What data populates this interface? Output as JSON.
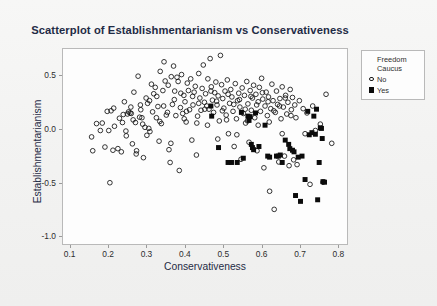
{
  "chart_data": {
    "type": "scatter",
    "title": "Scatterplot of Establishmentarianism vs Conservativeness",
    "xlabel": "Conservativeness",
    "ylabel": "Establishmentarianism",
    "xlim": [
      0.08,
      0.825
    ],
    "ylim": [
      -1.08,
      0.75
    ],
    "xticks": [
      0.1,
      0.2,
      0.3,
      0.4,
      0.5,
      0.6,
      0.7,
      0.8
    ],
    "xtick_labels": [
      "0.1",
      "0.2",
      "0.3",
      "0.4",
      "0.5",
      "0.6",
      "0.7",
      "0.8"
    ],
    "yticks": [
      0.5,
      0.0,
      -0.5,
      -1.0
    ],
    "ytick_labels": [
      "0.5",
      "0.0",
      "-0.5",
      "-1.0"
    ],
    "grid": false,
    "legend_position": "outside-top-right",
    "legend": {
      "title_line1": "Freedom",
      "title_line2": "Caucus",
      "entries": [
        {
          "label": "No",
          "marker": "open-circle",
          "color": "#111111"
        },
        {
          "label": "Yes",
          "marker": "filled-square",
          "color": "#0b0b0b"
        }
      ]
    },
    "series": [
      {
        "name": "No",
        "marker": "open-circle",
        "color": "#111111",
        "points": [
          [
            0.155,
            -0.075
          ],
          [
            0.158,
            -0.205
          ],
          [
            0.178,
            -0.015
          ],
          [
            0.183,
            0.055
          ],
          [
            0.196,
            0.165
          ],
          [
            0.2,
            -0.015
          ],
          [
            0.203,
            -0.505
          ],
          [
            0.206,
            0.17
          ],
          [
            0.211,
            -0.2
          ],
          [
            0.215,
            0.025
          ],
          [
            0.224,
            -0.185
          ],
          [
            0.228,
            0.1
          ],
          [
            0.233,
            -0.215
          ],
          [
            0.236,
            0.06
          ],
          [
            0.241,
            0.255
          ],
          [
            0.245,
            -0.02
          ],
          [
            0.249,
            0.14
          ],
          [
            0.252,
            0.16
          ],
          [
            0.256,
            0.15
          ],
          [
            0.259,
            0.145
          ],
          [
            0.262,
            -0.14
          ],
          [
            0.266,
            0.345
          ],
          [
            0.27,
            0.06
          ],
          [
            0.273,
            -0.205
          ],
          [
            0.277,
            0.495
          ],
          [
            0.281,
            0.11
          ],
          [
            0.284,
            0.18
          ],
          [
            0.287,
            0.105
          ],
          [
            0.291,
            -0.27
          ],
          [
            0.295,
            0.015
          ],
          [
            0.298,
            0.29
          ],
          [
            0.302,
            0.24
          ],
          [
            0.305,
            0.005
          ],
          [
            0.308,
            -0.025
          ],
          [
            0.312,
            0.42
          ],
          [
            0.315,
            0.16
          ],
          [
            0.318,
            0.33
          ],
          [
            0.322,
            0.39
          ],
          [
            0.325,
            0.105
          ],
          [
            0.329,
            0.21
          ],
          [
            0.332,
            -0.115
          ],
          [
            0.335,
            0.54
          ],
          [
            0.338,
            0.05
          ],
          [
            0.342,
            0.36
          ],
          [
            0.345,
            0.63
          ],
          [
            0.348,
            0.45
          ],
          [
            0.351,
            0.13
          ],
          [
            0.354,
            0.155
          ],
          [
            0.358,
            -0.195
          ],
          [
            0.361,
            -0.315
          ],
          [
            0.364,
            0.49
          ],
          [
            0.367,
            0.23
          ],
          [
            0.37,
            0.59
          ],
          [
            0.373,
            0.355
          ],
          [
            0.376,
            0.125
          ],
          [
            0.379,
            0.485
          ],
          [
            0.382,
            0.445
          ],
          [
            0.385,
            -0.39
          ],
          [
            0.388,
            0.2
          ],
          [
            0.391,
            0.51
          ],
          [
            0.394,
            0.145
          ],
          [
            0.397,
            0.315
          ],
          [
            0.4,
            0.255
          ],
          [
            0.403,
            0.065
          ],
          [
            0.406,
            0.43
          ],
          [
            0.409,
            0.36
          ],
          [
            0.412,
            0.18
          ],
          [
            0.415,
            0.47
          ],
          [
            0.418,
            -0.105
          ],
          [
            0.421,
            0.225
          ],
          [
            0.424,
            0.345
          ],
          [
            0.427,
            0.4
          ],
          [
            0.43,
            -0.245
          ],
          [
            0.433,
            0.12
          ],
          [
            0.436,
            0.52
          ],
          [
            0.439,
            0.29
          ],
          [
            0.442,
            0.175
          ],
          [
            0.445,
            0.38
          ],
          [
            0.448,
            0.6
          ],
          [
            0.451,
            0.25
          ],
          [
            0.454,
            0.33
          ],
          [
            0.457,
            0.215
          ],
          [
            0.46,
            0.47
          ],
          [
            0.463,
            0.185
          ],
          [
            0.466,
            0.66
          ],
          [
            0.469,
            0.395
          ],
          [
            0.472,
            0.27
          ],
          [
            0.475,
            0.155
          ],
          [
            0.478,
            0.34
          ],
          [
            0.481,
            0.44
          ],
          [
            0.484,
            0.225
          ],
          [
            0.487,
            0.31
          ],
          [
            0.49,
            0.075
          ],
          [
            0.493,
            0.69
          ],
          [
            0.496,
            0.415
          ],
          [
            0.499,
            0.285
          ],
          [
            0.502,
            0.195
          ],
          [
            0.505,
            0.355
          ],
          [
            0.508,
            0.13
          ],
          [
            0.511,
            0.46
          ],
          [
            0.514,
            -0.045
          ],
          [
            0.517,
            0.24
          ],
          [
            0.52,
            0.37
          ],
          [
            0.523,
            0.3
          ],
          [
            0.526,
            0.165
          ],
          [
            0.529,
            -0.165
          ],
          [
            0.532,
            0.425
          ],
          [
            0.535,
            0.095
          ],
          [
            0.538,
            0.265
          ],
          [
            0.541,
            0.335
          ],
          [
            0.544,
            0.205
          ],
          [
            0.547,
            -0.285
          ],
          [
            0.55,
            0.385
          ],
          [
            0.553,
            0.145
          ],
          [
            0.556,
            0.315
          ],
          [
            0.559,
            0.055
          ],
          [
            0.562,
            0.445
          ],
          [
            0.565,
            0.235
          ],
          [
            0.568,
            -0.125
          ],
          [
            0.571,
            0.36
          ],
          [
            0.574,
            0.175
          ],
          [
            0.577,
            0.29
          ],
          [
            0.58,
            0.41
          ],
          [
            0.583,
            0.105
          ],
          [
            0.586,
            0.325
          ],
          [
            0.589,
            -0.205
          ],
          [
            0.592,
            0.255
          ],
          [
            0.595,
            0.39
          ],
          [
            0.598,
            0.165
          ],
          [
            0.601,
            0.475
          ],
          [
            0.604,
            0.28
          ],
          [
            0.607,
            -0.365
          ],
          [
            0.61,
            0.215
          ],
          [
            0.613,
            0.345
          ],
          [
            0.616,
            0.125
          ],
          [
            0.619,
            0.3
          ],
          [
            0.622,
            -0.585
          ],
          [
            0.625,
            0.19
          ],
          [
            0.628,
            0.42
          ],
          [
            0.631,
            0.265
          ],
          [
            0.634,
            -0.755
          ],
          [
            0.637,
            0.155
          ],
          [
            0.64,
            0.355
          ],
          [
            0.643,
            0.23
          ],
          [
            0.646,
            -0.31
          ],
          [
            0.649,
            0.285
          ],
          [
            0.652,
            0.095
          ],
          [
            0.655,
            0.395
          ],
          [
            0.658,
            0.205
          ],
          [
            0.661,
            -0.255
          ],
          [
            0.664,
            0.315
          ],
          [
            0.667,
            0.14
          ],
          [
            0.67,
            0.25
          ],
          [
            0.673,
            -0.345
          ],
          [
            0.676,
            0.37
          ],
          [
            0.679,
            0.18
          ],
          [
            0.682,
            0.295
          ],
          [
            0.685,
            -0.29
          ],
          [
            0.688,
            0.225
          ],
          [
            0.691,
            0.105
          ],
          [
            0.694,
            -0.335
          ],
          [
            0.7,
            0.265
          ],
          [
            0.71,
            0.19
          ],
          [
            0.715,
            -0.045
          ],
          [
            0.72,
            0.15
          ],
          [
            0.728,
            -0.52
          ],
          [
            0.735,
            0.215
          ],
          [
            0.742,
            -0.015
          ],
          [
            0.755,
            0.045
          ],
          [
            0.762,
            -0.5
          ],
          [
            0.77,
            0.325
          ],
          [
            0.785,
            -0.135
          ],
          [
            0.168,
            0.05
          ],
          [
            0.19,
            -0.17
          ],
          [
            0.213,
            0.195
          ],
          [
            0.238,
            0.135
          ],
          [
            0.258,
            0.205
          ],
          [
            0.272,
            -0.235
          ],
          [
            0.289,
            0.045
          ],
          [
            0.307,
            0.265
          ],
          [
            0.326,
            0.305
          ],
          [
            0.344,
            0.215
          ],
          [
            0.356,
            0.41
          ],
          [
            0.372,
            0.275
          ],
          [
            0.389,
            0.335
          ],
          [
            0.404,
            0.165
          ],
          [
            0.42,
            0.305
          ],
          [
            0.436,
            0.24
          ],
          [
            0.452,
            0.185
          ],
          [
            0.468,
            0.355
          ],
          [
            0.483,
            0.26
          ],
          [
            0.498,
            0.17
          ],
          [
            0.513,
            0.325
          ],
          [
            0.528,
            0.23
          ],
          [
            0.543,
            0.275
          ],
          [
            0.558,
            0.185
          ],
          [
            0.573,
            0.305
          ],
          [
            0.588,
            0.225
          ],
          [
            0.603,
            0.34
          ],
          [
            0.618,
            0.255
          ],
          [
            0.633,
            0.17
          ],
          [
            0.648,
            0.215
          ],
          [
            0.663,
            0.29
          ],
          [
            0.678,
            0.125
          ],
          [
            0.246,
            -0.065
          ],
          [
            0.264,
            0.085
          ],
          [
            0.283,
            0.225
          ],
          [
            0.3,
            -0.06
          ],
          [
            0.334,
            0.07
          ],
          [
            0.363,
            -0.135
          ],
          [
            0.398,
            0.095
          ],
          [
            0.431,
            0.055
          ],
          [
            0.459,
            0.035
          ],
          [
            0.486,
            -0.095
          ],
          [
            0.509,
            0.085
          ],
          [
            0.536,
            -0.055
          ],
          [
            0.564,
            0.075
          ],
          [
            0.592,
            0.035
          ],
          [
            0.621,
            0.065
          ],
          [
            0.655,
            -0.045
          ]
        ]
      },
      {
        "name": "Yes",
        "marker": "filled-square",
        "color": "#0b0b0b",
        "points": [
          [
            0.468,
            0.215
          ],
          [
            0.47,
            0.12
          ],
          [
            0.488,
            -0.175
          ],
          [
            0.513,
            -0.315
          ],
          [
            0.522,
            -0.315
          ],
          [
            0.537,
            -0.315
          ],
          [
            0.548,
            0.155
          ],
          [
            0.553,
            -0.275
          ],
          [
            0.565,
            0.12
          ],
          [
            0.568,
            0.08
          ],
          [
            0.571,
            0.115
          ],
          [
            0.574,
            -0.145
          ],
          [
            0.577,
            -0.175
          ],
          [
            0.58,
            -0.195
          ],
          [
            0.585,
            0.15
          ],
          [
            0.594,
            -0.165
          ],
          [
            0.61,
            0.035
          ],
          [
            0.617,
            -0.255
          ],
          [
            0.622,
            -0.265
          ],
          [
            0.64,
            -0.255
          ],
          [
            0.645,
            -0.255
          ],
          [
            0.65,
            -0.245
          ],
          [
            0.655,
            -0.315
          ],
          [
            0.663,
            -0.105
          ],
          [
            0.672,
            -0.145
          ],
          [
            0.675,
            -0.185
          ],
          [
            0.682,
            -0.2
          ],
          [
            0.686,
            -0.215
          ],
          [
            0.69,
            -0.625
          ],
          [
            0.697,
            -0.265
          ],
          [
            0.703,
            -0.68
          ],
          [
            0.707,
            -0.255
          ],
          [
            0.715,
            -0.475
          ],
          [
            0.722,
            0.165
          ],
          [
            0.726,
            -0.055
          ],
          [
            0.733,
            -0.035
          ],
          [
            0.738,
            0.12
          ],
          [
            0.742,
            -0.05
          ],
          [
            0.745,
            0.185
          ],
          [
            0.748,
            -0.665
          ],
          [
            0.752,
            -0.315
          ],
          [
            0.755,
            0.01
          ],
          [
            0.758,
            0.005
          ],
          [
            0.76,
            -0.09
          ],
          [
            0.762,
            -0.495
          ],
          [
            0.766,
            -0.5
          ]
        ]
      }
    ]
  }
}
